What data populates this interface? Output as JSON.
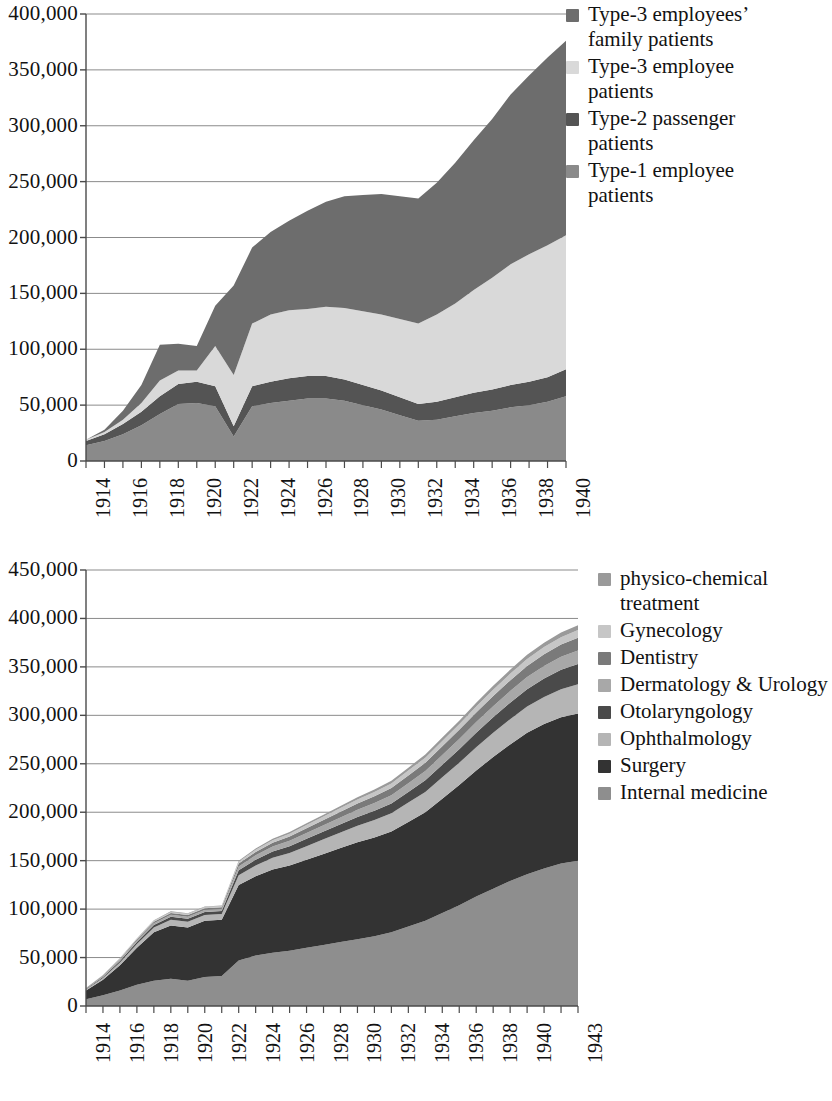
{
  "figures": [
    {
      "id": "patients-by-type",
      "legend": {
        "items": [
          {
            "label": "Type-3 employees’\nfamily patients",
            "color": "#6d6d6d"
          },
          {
            "label": "Type-3 employee\npatients",
            "color": "#d9d9d9"
          },
          {
            "label": "Type-2 passenger\npatients",
            "color": "#545454"
          },
          {
            "label": "Type-1 employee\npatients",
            "color": "#8a8a8a"
          }
        ]
      },
      "chart_data": {
        "type": "area",
        "stacked": true,
        "title": "",
        "xlabel": "",
        "ylabel": "",
        "xlim": [
          1914,
          1940
        ],
        "ylim": [
          0,
          400000
        ],
        "ytick_step": 50000,
        "grid": true,
        "legend_position": "right",
        "yticks": [
          "400,000",
          "350,000",
          "300,000",
          "250,000",
          "200,000",
          "150,000",
          "100,000",
          "50,000",
          "0"
        ],
        "ytick_values": [
          400000,
          350000,
          300000,
          250000,
          200000,
          150000,
          100000,
          50000,
          0
        ],
        "xticks": [
          "1914",
          "1916",
          "1918",
          "1920",
          "1922",
          "1924",
          "1926",
          "1928",
          "1930",
          "1932",
          "1934",
          "1936",
          "1938",
          "1940"
        ],
        "xtick_values": [
          1914,
          1916,
          1918,
          1920,
          1922,
          1924,
          1926,
          1928,
          1930,
          1932,
          1934,
          1936,
          1938,
          1940
        ],
        "x": [
          1914,
          1915,
          1916,
          1917,
          1918,
          1919,
          1920,
          1921,
          1922,
          1923,
          1924,
          1925,
          1926,
          1927,
          1928,
          1929,
          1930,
          1931,
          1932,
          1933,
          1934,
          1935,
          1936,
          1937,
          1938,
          1939,
          1940
        ],
        "series": [
          {
            "name": "Type-1 employee patients",
            "color": "#8a8a8a",
            "values": [
              14000,
              18000,
              24000,
              32000,
              42000,
              51000,
              52000,
              49000,
              22000,
              49000,
              52000,
              54000,
              56000,
              56000,
              54000,
              50000,
              46000,
              41000,
              36000,
              37000,
              40000,
              43000,
              45000,
              48000,
              50000,
              53000,
              58000
            ]
          },
          {
            "name": "Type-2 passenger patients",
            "color": "#545454",
            "values": [
              4000,
              6000,
              9000,
              12000,
              16000,
              18000,
              19000,
              18000,
              9000,
              18000,
              19000,
              20000,
              20000,
              20000,
              19000,
              18000,
              17000,
              16000,
              15000,
              16000,
              17000,
              18000,
              19000,
              20000,
              21000,
              22000,
              24000
            ]
          },
          {
            "name": "Type-3 employee patients",
            "color": "#d9d9d9",
            "values": [
              1000,
              2000,
              4000,
              8000,
              14000,
              12000,
              10000,
              36000,
              46000,
              56000,
              60000,
              61000,
              60000,
              62000,
              64000,
              66000,
              68000,
              70000,
              72000,
              78000,
              84000,
              92000,
              100000,
              108000,
              114000,
              118000,
              120000
            ]
          },
          {
            "name": "Type-3 employees’ family patients",
            "color": "#6d6d6d",
            "values": [
              0,
              2000,
              8000,
              16000,
              32000,
              24000,
              22000,
              36000,
              80000,
              68000,
              74000,
              80000,
              88000,
              94000,
              100000,
              104000,
              108000,
              110000,
              112000,
              118000,
              126000,
              134000,
              142000,
              152000,
              160000,
              168000,
              174000
            ]
          }
        ]
      }
    },
    {
      "id": "patients-by-department",
      "legend": {
        "items": [
          {
            "label": "physico-chemical\ntreatment",
            "color": "#9a9a9a"
          },
          {
            "label": "Gynecology",
            "color": "#c6c6c6"
          },
          {
            "label": "Dentistry",
            "color": "#7a7a7a"
          },
          {
            "label": "Dermatology & Urology",
            "color": "#a8a8a8"
          },
          {
            "label": "Otolaryngology",
            "color": "#4a4a4a"
          },
          {
            "label": "Ophthalmology",
            "color": "#b5b5b5"
          },
          {
            "label": "Surgery",
            "color": "#333333"
          },
          {
            "label": "Internal medicine",
            "color": "#8e8e8e"
          }
        ]
      },
      "chart_data": {
        "type": "area",
        "stacked": true,
        "title": "",
        "xlabel": "",
        "ylabel": "",
        "xlim": [
          1914,
          1943
        ],
        "ylim": [
          0,
          450000
        ],
        "ytick_step": 50000,
        "grid": true,
        "legend_position": "right",
        "yticks": [
          "450,000",
          "400,000",
          "350,000",
          "300,000",
          "250,000",
          "200,000",
          "150,000",
          "100,000",
          "50,000",
          "0"
        ],
        "ytick_values": [
          450000,
          400000,
          350000,
          300000,
          250000,
          200000,
          150000,
          100000,
          50000,
          0
        ],
        "xticks": [
          "1914",
          "1916",
          "1918",
          "1920",
          "1922",
          "1924",
          "1926",
          "1928",
          "1930",
          "1932",
          "1934",
          "1936",
          "1938",
          "1940",
          "1943"
        ],
        "xtick_values": [
          1914,
          1916,
          1918,
          1920,
          1922,
          1924,
          1926,
          1928,
          1930,
          1932,
          1934,
          1936,
          1938,
          1940,
          1943
        ],
        "x": [
          1914,
          1915,
          1916,
          1917,
          1918,
          1919,
          1920,
          1921,
          1922,
          1923,
          1924,
          1925,
          1926,
          1927,
          1928,
          1929,
          1930,
          1931,
          1932,
          1933,
          1934,
          1935,
          1936,
          1937,
          1938,
          1939,
          1940,
          1941,
          1942,
          1943
        ],
        "series": [
          {
            "name": "Internal medicine",
            "color": "#8e8e8e",
            "values": [
              7000,
              11000,
              16000,
              22000,
              26000,
              28000,
              26000,
              30000,
              31000,
              47000,
              52000,
              55000,
              57000,
              60000,
              63000,
              66000,
              69000,
              72000,
              76000,
              82000,
              88000,
              96000,
              104000,
              113000,
              121000,
              129000,
              136000,
              142000,
              147000,
              150000
            ]
          },
          {
            "name": "Surgery",
            "color": "#333333",
            "values": [
              9000,
              16000,
              26000,
              38000,
              50000,
              55000,
              55000,
              58000,
              58000,
              78000,
              82000,
              86000,
              88000,
              91000,
              94000,
              97000,
              100000,
              102000,
              104000,
              108000,
              112000,
              118000,
              124000,
              130000,
              136000,
              141000,
              146000,
              149000,
              151000,
              152000
            ]
          },
          {
            "name": "Ophthalmology",
            "color": "#b5b5b5",
            "values": [
              1000,
              2000,
              3000,
              4000,
              5000,
              6000,
              6000,
              6000,
              6000,
              10000,
              11000,
              12000,
              13000,
              14000,
              15000,
              16000,
              17000,
              18000,
              19000,
              20000,
              21000,
              22000,
              23000,
              24000,
              25000,
              26000,
              27000,
              28000,
              29000,
              30000
            ]
          },
          {
            "name": "Otolaryngology",
            "color": "#4a4a4a",
            "values": [
              500,
              1000,
              1500,
              2000,
              2500,
              3000,
              3000,
              3000,
              3000,
              5000,
              6000,
              6500,
              7000,
              7500,
              8000,
              8500,
              9000,
              9500,
              10000,
              11000,
              12000,
              13000,
              14000,
              15000,
              16000,
              17000,
              18000,
              19000,
              20000,
              21000
            ]
          },
          {
            "name": "Dermatology & Urology",
            "color": "#a8a8a8",
            "values": [
              400,
              800,
              1200,
              1600,
              2000,
              2200,
              2200,
              2200,
              2200,
              4000,
              4500,
              5000,
              5500,
              6000,
              6500,
              7000,
              7500,
              8000,
              8500,
              9000,
              9500,
              10000,
              10500,
              11000,
              11500,
              12000,
              12500,
              13000,
              13500,
              14000
            ]
          },
          {
            "name": "Dentistry",
            "color": "#7a7a7a",
            "values": [
              300,
              600,
              900,
              1200,
              1500,
              1700,
              1700,
              1700,
              1700,
              3000,
              3500,
              4000,
              4500,
              5000,
              5500,
              6000,
              6500,
              7000,
              7500,
              8000,
              8500,
              9000,
              9500,
              10000,
              10500,
              11000,
              11500,
              12000,
              12500,
              13000
            ]
          },
          {
            "name": "Gynecology",
            "color": "#c6c6c6",
            "values": [
              200,
              400,
              600,
              800,
              1000,
              1200,
              1200,
              1200,
              1200,
              2000,
              2300,
              2600,
              2900,
              3200,
              3500,
              3800,
              4100,
              4400,
              4700,
              5000,
              5300,
              5600,
              5900,
              6200,
              6500,
              6800,
              7100,
              7400,
              7700,
              8000
            ]
          },
          {
            "name": "physico-chemical treatment",
            "color": "#9a9a9a",
            "values": [
              100,
              200,
              300,
              400,
              500,
              600,
              600,
              600,
              600,
              1000,
              1200,
              1400,
              1600,
              1800,
              2000,
              2200,
              2400,
              2600,
              2800,
              3000,
              3200,
              3400,
              3600,
              3800,
              4000,
              4200,
              4400,
              4600,
              4800,
              5000
            ]
          }
        ]
      }
    }
  ]
}
